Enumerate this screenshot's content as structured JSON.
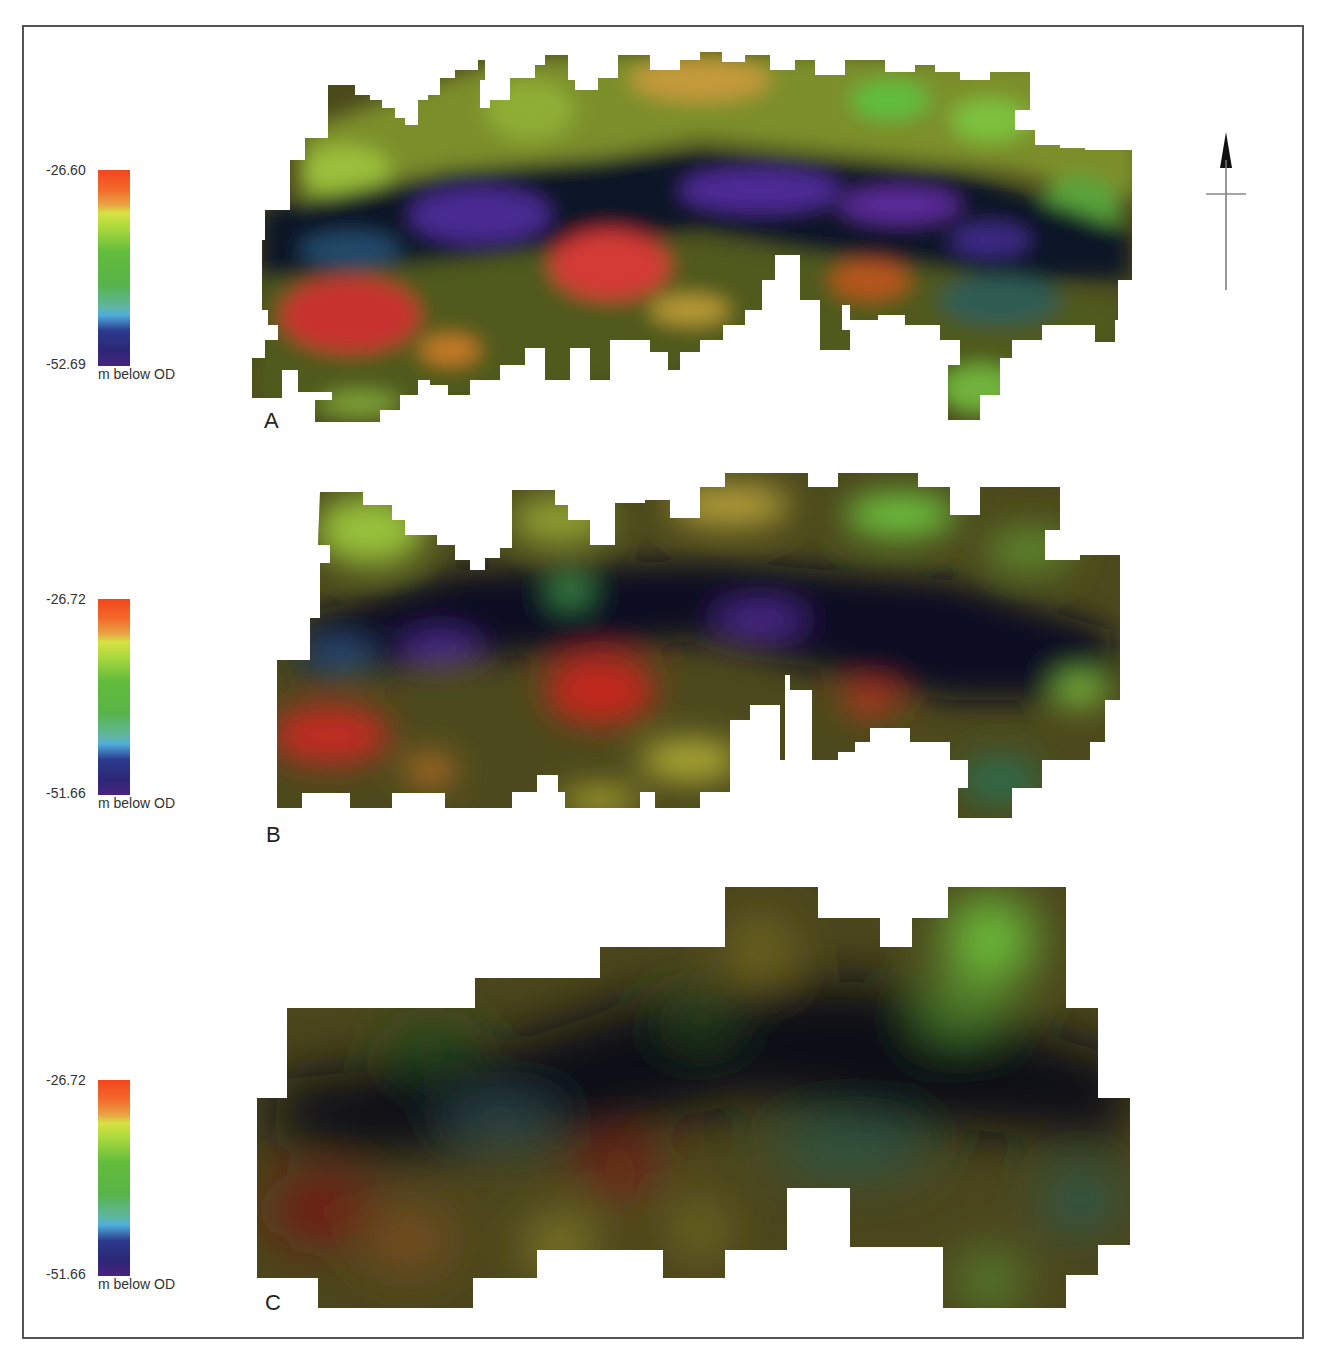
{
  "figure": {
    "panels": [
      {
        "id": "A",
        "label": "A",
        "legend": {
          "max": "-26.60",
          "min": "-52.69",
          "unit": "m below OD"
        },
        "description": "Gridded depth surface, finest resolution; purple trough band running WNW-ESE with red highs to the south-west and centre"
      },
      {
        "id": "B",
        "label": "B",
        "legend": {
          "max": "-26.72",
          "min": "-51.66",
          "unit": "m below OD"
        },
        "description": "Same surface at intermediate resolution; smoother dark trough band, red highs SW and centre"
      },
      {
        "id": "C",
        "label": "C",
        "legend": {
          "max": "-26.72",
          "min": "-51.66",
          "unit": "m below OD"
        },
        "description": "Same surface at coarsest resolution; broad dark trough band, bright green high in the NE"
      }
    ],
    "north_arrow": {
      "icon": "north-arrow-icon"
    },
    "colorscale": [
      "#f2461f",
      "#e9a545",
      "#d7e243",
      "#62bc3c",
      "#4faedb",
      "#2d3a8e",
      "#4a237e"
    ]
  }
}
